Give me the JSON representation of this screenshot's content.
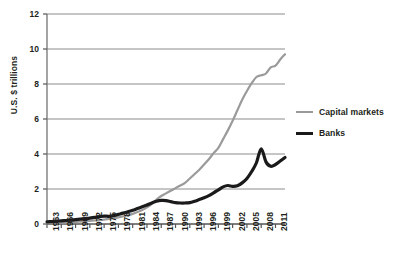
{
  "chart_data": {
    "type": "line",
    "title": "",
    "xlabel": "",
    "ylabel": "U.S. $ trillions",
    "ylim": [
      0,
      12
    ],
    "xlim": [
      1963,
      2013
    ],
    "yticks": [
      "0",
      "2",
      "4",
      "6",
      "8",
      "10",
      "12"
    ],
    "ytick_values": [
      0,
      2,
      4,
      6,
      8,
      10,
      12
    ],
    "xticks": [
      "1963",
      "1966",
      "1969",
      "1972",
      "1975",
      "1978",
      "1981",
      "1984",
      "1987",
      "1990",
      "1993",
      "1996",
      "1999",
      "2002",
      "2005",
      "2008",
      "2011"
    ],
    "xtick_values": [
      1963,
      1966,
      1969,
      1972,
      1975,
      1978,
      1981,
      1984,
      1987,
      1990,
      1993,
      1996,
      1999,
      2002,
      2005,
      2008,
      2011
    ],
    "grid": "horizontal",
    "legend_position": "right",
    "x": [
      1963,
      1964,
      1965,
      1966,
      1967,
      1968,
      1969,
      1970,
      1971,
      1972,
      1973,
      1974,
      1975,
      1976,
      1977,
      1978,
      1979,
      1980,
      1981,
      1982,
      1983,
      1984,
      1985,
      1986,
      1987,
      1988,
      1989,
      1990,
      1991,
      1992,
      1993,
      1994,
      1995,
      1996,
      1997,
      1998,
      1999,
      2000,
      2001,
      2002,
      2003,
      2004,
      2005,
      2006,
      2007,
      2008,
      2009,
      2010,
      2011,
      2012,
      2013
    ],
    "series": [
      {
        "name": "Capital markets",
        "color": "#9a9a9a",
        "width": 2.2,
        "values": [
          0.05,
          0.06,
          0.07,
          0.08,
          0.09,
          0.11,
          0.12,
          0.14,
          0.16,
          0.18,
          0.2,
          0.22,
          0.25,
          0.29,
          0.33,
          0.38,
          0.44,
          0.5,
          0.58,
          0.68,
          0.8,
          0.95,
          1.15,
          1.4,
          1.6,
          1.75,
          1.9,
          2.05,
          2.2,
          2.35,
          2.6,
          2.85,
          3.1,
          3.4,
          3.7,
          4.05,
          4.35,
          4.85,
          5.35,
          5.9,
          6.5,
          7.1,
          7.6,
          8.05,
          8.4,
          8.5,
          8.6,
          8.95,
          9.05,
          9.4,
          9.7
        ]
      },
      {
        "name": "Banks",
        "color": "#1a1a1a",
        "width": 3.2,
        "values": [
          0.12,
          0.14,
          0.16,
          0.18,
          0.2,
          0.22,
          0.25,
          0.28,
          0.31,
          0.34,
          0.38,
          0.42,
          0.45,
          0.44,
          0.48,
          0.55,
          0.62,
          0.7,
          0.78,
          0.88,
          0.98,
          1.08,
          1.2,
          1.3,
          1.35,
          1.34,
          1.28,
          1.22,
          1.2,
          1.2,
          1.22,
          1.3,
          1.4,
          1.5,
          1.62,
          1.78,
          1.95,
          2.12,
          2.2,
          2.15,
          2.18,
          2.35,
          2.6,
          3.0,
          3.5,
          4.3,
          3.55,
          3.3,
          3.4,
          3.6,
          3.8
        ]
      }
    ]
  },
  "legend": {
    "items": [
      {
        "label": "Capital markets",
        "series": "capital"
      },
      {
        "label": "Banks",
        "series": "banks"
      }
    ]
  },
  "axis": {
    "y_title": "U.S. $ trillions"
  }
}
